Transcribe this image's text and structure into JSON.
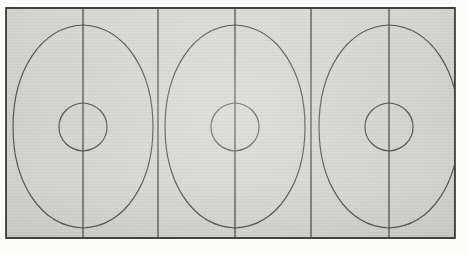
{
  "document": {
    "title": "Geometric construction drawing",
    "medium": "scanned pencil drawing on textured paper",
    "caption": ""
  },
  "colors": {
    "paper": "#d6d6d3",
    "paper_light": "#dededb",
    "paper_outer": "#fbfbfa",
    "ink": "#4a4a48",
    "ink_light": "#6e6e6a",
    "frame": "#3b3b39"
  },
  "frame": {
    "name": "outer-rectangle",
    "x": 6,
    "y": 8,
    "width": 449,
    "height": 230,
    "stroke_width": 1.6
  },
  "geometry": {
    "panel_count": 6,
    "figure_count": 3,
    "vertical_divider_x": [
      83,
      158,
      235,
      311,
      389
    ],
    "figure_centers_x": [
      83,
      235,
      389
    ],
    "oval_top_y": 25,
    "oval_bottom_y": 228,
    "oval_half_width": 70,
    "circle_radius": 24,
    "center_y": 127
  },
  "figures": [
    {
      "name": "vesica-figure-1",
      "center_x": 83,
      "label": "Figure 1"
    },
    {
      "name": "vesica-figure-2",
      "center_x": 235,
      "label": "Figure 2"
    },
    {
      "name": "vesica-figure-3",
      "center_x": 389,
      "label": "Figure 3"
    }
  ]
}
